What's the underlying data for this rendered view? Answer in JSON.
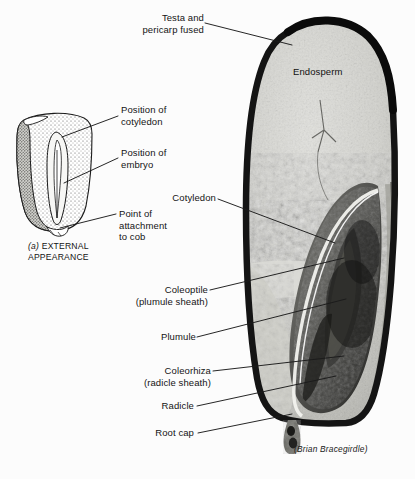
{
  "figure": {
    "title_credit": "(Brian Bracegirdle)",
    "panel_a_caption_prefix": "(a)",
    "panel_a_caption": " EXTERNAL\nAPPEARANCE"
  },
  "labels": {
    "testa": "Testa and\npericarp fused",
    "endosperm": "Endosperm",
    "position_cotyledon": "Position of\ncotyledon",
    "position_embryo": "Position of\nembryo",
    "point_attachment": "Point of\nattachment\nto cob",
    "cotyledon": "Cotyledon",
    "coleoptile": "Coleoptile\n(plumule sheath)",
    "plumule": "Plumule",
    "coleorhiza": "Coleorhiza\n(radicle sheath)",
    "radicle": "Radicle",
    "root_cap": "Root cap"
  },
  "colors": {
    "background": "#fcfcfc",
    "ink": "#141414",
    "leader_line": "#1a1a1a",
    "pericarp_dark": "#1d1d1d",
    "endosperm_light": "#d8d8d4",
    "embryo_mid": "#6e6e6a",
    "embryo_dark": "#2e2e2c",
    "stipple": "#3a3a38"
  }
}
